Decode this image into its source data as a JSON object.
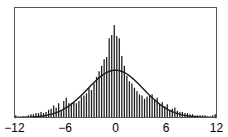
{
  "chart_data": {
    "type": "bar",
    "title": "",
    "xlabel": "",
    "ylabel": "",
    "xlim": [
      -12,
      12
    ],
    "grid": false,
    "legend": null,
    "x_ticks": [
      -12,
      -6,
      0,
      6,
      12
    ],
    "x_tick_labels": [
      "−12",
      "−6",
      "0",
      "6",
      "12"
    ],
    "bin_width": 0.3,
    "series": [
      {
        "name": "histogram",
        "type": "bar",
        "bin_centers": [
          -11.85,
          -11.55,
          -11.25,
          -10.95,
          -10.65,
          -10.35,
          -10.05,
          -9.75,
          -9.45,
          -9.15,
          -8.85,
          -8.55,
          -8.25,
          -7.95,
          -7.65,
          -7.35,
          -7.05,
          -6.75,
          -6.45,
          -6.15,
          -5.85,
          -5.55,
          -5.25,
          -4.95,
          -4.65,
          -4.35,
          -4.05,
          -3.75,
          -3.45,
          -3.15,
          -2.85,
          -2.55,
          -2.25,
          -1.95,
          -1.65,
          -1.35,
          -1.05,
          -0.75,
          -0.45,
          -0.15,
          0.15,
          0.45,
          0.75,
          1.05,
          1.35,
          1.65,
          1.95,
          2.25,
          2.55,
          2.85,
          3.15,
          3.45,
          3.75,
          4.05,
          4.35,
          4.65,
          4.95,
          5.25,
          5.55,
          5.85,
          6.15,
          6.45,
          6.75,
          7.05,
          7.35,
          7.65,
          7.95,
          8.25,
          8.55,
          8.85,
          9.15,
          9.45,
          9.75,
          10.05,
          10.35,
          10.65,
          10.95,
          11.25,
          11.55,
          11.85
        ],
        "values": [
          0.02,
          0.01,
          0.01,
          0.01,
          0.01,
          0.02,
          0.03,
          0.03,
          0.04,
          0.04,
          0.05,
          0.04,
          0.05,
          0.07,
          0.08,
          0.11,
          0.09,
          0.13,
          0.06,
          0.15,
          0.18,
          0.13,
          0.13,
          0.14,
          0.13,
          0.15,
          0.19,
          0.2,
          0.22,
          0.27,
          0.25,
          0.31,
          0.37,
          0.42,
          0.47,
          0.53,
          0.55,
          0.72,
          0.75,
          0.84,
          0.74,
          0.72,
          0.56,
          0.47,
          0.38,
          0.33,
          0.31,
          0.27,
          0.24,
          0.21,
          0.2,
          0.17,
          0.19,
          0.2,
          0.21,
          0.16,
          0.18,
          0.12,
          0.14,
          0.1,
          0.12,
          0.07,
          0.08,
          0.09,
          0.06,
          0.05,
          0.05,
          0.04,
          0.04,
          0.03,
          0.03,
          0.02,
          0.02,
          0.02,
          0.02,
          0.02,
          0.01,
          0.01,
          0.02,
          0.03
        ]
      },
      {
        "name": "normal fit",
        "type": "line",
        "mean": 0,
        "std": 3.3,
        "peak": 0.43
      }
    ]
  },
  "axes": {
    "frame_color": "#555555",
    "bar_color": "#1a1a1a",
    "curve_color": "#1a1a1a"
  }
}
